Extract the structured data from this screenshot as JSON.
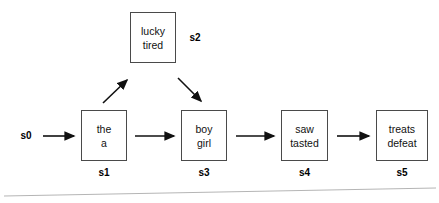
{
  "diagram": {
    "background_color": "#ffffff",
    "line_color": "#4a4a4a",
    "text_color": "#111111",
    "start_label": "s0",
    "states": [
      {
        "id": "s1",
        "label": "s1",
        "words": [
          "the",
          "a"
        ],
        "x": 81,
        "y": 110,
        "width": 46,
        "height": 51
      },
      {
        "id": "s2",
        "label": "s2",
        "words": [
          "lucky",
          "tired"
        ],
        "x": 130,
        "y": 12,
        "width": 46,
        "height": 51
      },
      {
        "id": "s3",
        "label": "s3",
        "words": [
          "boy",
          "girl"
        ],
        "x": 181,
        "y": 110,
        "width": 46,
        "height": 51
      },
      {
        "id": "s4",
        "label": "s4",
        "words": [
          "saw",
          "tasted"
        ],
        "x": 281,
        "y": 110,
        "width": 47,
        "height": 51
      },
      {
        "id": "s5",
        "label": "s5",
        "words": [
          "treats",
          "defeat"
        ],
        "x": 376,
        "y": 110,
        "width": 52,
        "height": 51
      }
    ],
    "transitions": [
      {
        "from": "s0",
        "to": "s1",
        "kind": "horizontal"
      },
      {
        "from": "s1",
        "to": "s2",
        "kind": "diagonal-up"
      },
      {
        "from": "s1",
        "to": "s3",
        "kind": "horizontal"
      },
      {
        "from": "s2",
        "to": "s3",
        "kind": "diagonal-down"
      },
      {
        "from": "s3",
        "to": "s4",
        "kind": "horizontal"
      },
      {
        "from": "s4",
        "to": "s5",
        "kind": "horizontal"
      }
    ]
  }
}
